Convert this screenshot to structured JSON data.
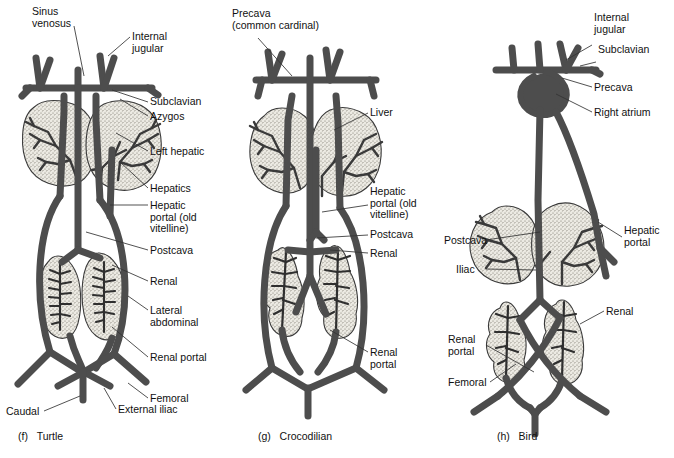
{
  "figure": {
    "background": "#ffffff",
    "vessel_color": "#4d4d4d",
    "vessel_stroke": "#2b2b2b",
    "organ_fill": "#e9e7e0",
    "organ_stroke": "#3a3a3a",
    "leader_color": "#333333",
    "text_color": "#111111"
  },
  "panels": [
    {
      "key": "turtle",
      "caption_letter": "(f)",
      "caption_name": "Turtle",
      "labels": [
        {
          "name": "sinus-venosus",
          "text": "Sinus\nvenosus"
        },
        {
          "name": "internal-jugular",
          "text": "Internal\njugular"
        },
        {
          "name": "subclavian",
          "text": "Subclavian"
        },
        {
          "name": "azygos",
          "text": "Azygos"
        },
        {
          "name": "left-hepatic",
          "text": "Left hepatic"
        },
        {
          "name": "hepatics",
          "text": "Hepatics"
        },
        {
          "name": "hepatic-portal",
          "text": "Hepatic\nportal (old\nvitelline)"
        },
        {
          "name": "postcava",
          "text": "Postcava"
        },
        {
          "name": "renal",
          "text": "Renal"
        },
        {
          "name": "lateral-abdominal",
          "text": "Lateral\nabdominal"
        },
        {
          "name": "renal-portal",
          "text": "Renal portal"
        },
        {
          "name": "femoral",
          "text": "Femoral"
        },
        {
          "name": "external-iliac",
          "text": "External iliac"
        },
        {
          "name": "caudal",
          "text": "Caudal"
        }
      ]
    },
    {
      "key": "crocodilian",
      "caption_letter": "(g)",
      "caption_name": "Crocodilian",
      "labels": [
        {
          "name": "precava",
          "text": "Precava\n(common cardinal)"
        },
        {
          "name": "liver",
          "text": "Liver"
        },
        {
          "name": "hepatic-portal",
          "text": "Hepatic\nportal (old\nvitelline)"
        },
        {
          "name": "postcava",
          "text": "Postcava"
        },
        {
          "name": "renal",
          "text": "Renal"
        },
        {
          "name": "renal-portal",
          "text": "Renal\nportal"
        }
      ]
    },
    {
      "key": "bird",
      "caption_letter": "(h)",
      "caption_name": "Bird",
      "labels": [
        {
          "name": "internal-jugular",
          "text": "Internal\njugular"
        },
        {
          "name": "subclavian",
          "text": "Subclavian"
        },
        {
          "name": "precava",
          "text": "Precava"
        },
        {
          "name": "right-atrium",
          "text": "Right atrium"
        },
        {
          "name": "postcava",
          "text": "Postcava"
        },
        {
          "name": "hepatic-portal",
          "text": "Hepatic\nportal"
        },
        {
          "name": "iliac",
          "text": "Iliac"
        },
        {
          "name": "renal",
          "text": "Renal"
        },
        {
          "name": "renal-portal",
          "text": "Renal\nportal"
        },
        {
          "name": "femoral",
          "text": "Femoral"
        }
      ]
    }
  ]
}
